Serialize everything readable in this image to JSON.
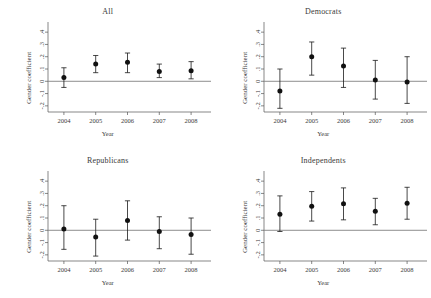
{
  "figure": {
    "panel_count": 4,
    "axis": {
      "xlabel": "Year",
      "ylabel": "Gender coefficient",
      "xticks": [
        "2004",
        "2005",
        "2006",
        "2007",
        "2008"
      ],
      "yticks": [
        "-.2",
        "-.1",
        "0",
        ".1",
        ".2",
        ".3",
        ".4"
      ]
    }
  },
  "chart_data": {
    "type": "scatter",
    "title": "",
    "xlabel": "Year",
    "ylabel": "Gender coefficient",
    "x": [
      2004,
      2005,
      2006,
      2007,
      2008
    ],
    "xlim": [
      2003.5,
      2008.5
    ],
    "ylim": [
      -0.25,
      0.45
    ],
    "yticks": [
      -0.2,
      -0.1,
      0,
      0.1,
      0.2,
      0.3,
      0.4
    ],
    "ytick_labels": [
      "-.2",
      "-.1",
      "0",
      ".1",
      ".2",
      ".3",
      ".4"
    ],
    "xtick_labels": [
      "2004",
      "2005",
      "2006",
      "2007",
      "2008"
    ],
    "grid": false,
    "legend": "none",
    "reference_line": {
      "y": 0,
      "style": "solid",
      "color": "#808080"
    },
    "error_bar_type": "confidence interval",
    "panels": [
      {
        "name": "All",
        "title": "All",
        "values": [
          0.03,
          0.14,
          0.155,
          0.08,
          0.085
        ],
        "ci_low": [
          -0.05,
          0.07,
          0.07,
          0.03,
          0.02
        ],
        "ci_high": [
          0.11,
          0.21,
          0.23,
          0.14,
          0.16
        ]
      },
      {
        "name": "Democrats",
        "title": "Democrats",
        "values": [
          -0.08,
          0.2,
          0.125,
          0.01,
          -0.005
        ],
        "ci_low": [
          -0.22,
          0.05,
          -0.05,
          -0.145,
          -0.18
        ],
        "ci_high": [
          0.1,
          0.32,
          0.27,
          0.17,
          0.2
        ]
      },
      {
        "name": "Republicans",
        "title": "Republicans",
        "values": [
          0.01,
          -0.055,
          0.08,
          -0.01,
          -0.035
        ],
        "ci_low": [
          -0.155,
          -0.21,
          -0.08,
          -0.15,
          -0.195
        ],
        "ci_high": [
          0.2,
          0.09,
          0.24,
          0.11,
          0.1
        ]
      },
      {
        "name": "Independents",
        "title": "Independents",
        "values": [
          0.13,
          0.195,
          0.215,
          0.155,
          0.22
        ],
        "ci_low": [
          -0.01,
          0.075,
          0.085,
          0.045,
          0.09
        ],
        "ci_high": [
          0.28,
          0.315,
          0.345,
          0.26,
          0.35
        ]
      }
    ]
  }
}
